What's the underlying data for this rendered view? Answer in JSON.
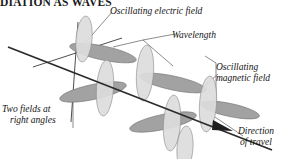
{
  "page": {
    "title": "DIATION AS WAVES",
    "background": "#ffffff",
    "width": 288,
    "height": 159
  },
  "heading": {
    "text": "DIATION AS WAVES",
    "color": "#1a1a1a",
    "clipped_top": true
  },
  "labels": {
    "electric_field": "Oscillating electric field",
    "wavelength": "Wavelength",
    "magnetic_field_line1": "Oscillating",
    "magnetic_field_line2": "magnetic field",
    "two_fields_line1": "Two fields at",
    "two_fields_line2": "right angles",
    "direction_line1": "Direction",
    "direction_line2": "of travel"
  },
  "colors": {
    "electric_lobe_fill": "#dcdcdc",
    "electric_lobe_stroke": "#8a8a8a",
    "magnetic_lobe_fill": "#a2a2a2",
    "magnetic_lobe_stroke": "#6e6e6e",
    "axis_line": "#333333",
    "travel_axis": "#2b2b2b",
    "leader_line": "#555555",
    "text": "#141414"
  },
  "diagram": {
    "type": "electromagnetic-wave",
    "propagation_axis": {
      "x1": 10,
      "y1": 48,
      "x2": 272,
      "y2": 150
    },
    "vertical_axis": {
      "x1": 78,
      "y1": 22,
      "x2": 71,
      "y2": 122
    },
    "transverse_axis": {
      "x1": 36,
      "y1": 66,
      "x2": 120,
      "y2": 39
    },
    "wavelength_bracket": {
      "start_x": 114,
      "end_x": 176,
      "y": 40
    },
    "magnetic_bracket": {
      "x": 212,
      "top_y": 56,
      "bottom_y": 110
    },
    "electric_lobe_count": 4,
    "magnetic_lobe_count": 4,
    "arrow_tip": {
      "x": 230,
      "y": 128
    }
  }
}
